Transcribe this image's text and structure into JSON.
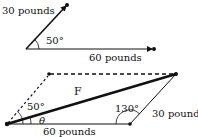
{
  "top_diagram": {
    "vector_a_label": "30 pounds",
    "vector_b_label": "60 pounds",
    "angle_label": "50°"
  },
  "bottom_diagram": {
    "resultant_label": "F",
    "angle_left_label": "50°",
    "angle_theta_label": "θ",
    "angle_right_label": "130°",
    "side_right_label": "30 pounds",
    "side_bottom_label": "60 pounds"
  },
  "colors": {
    "stroke": "#111111",
    "background": "#ffffff"
  }
}
